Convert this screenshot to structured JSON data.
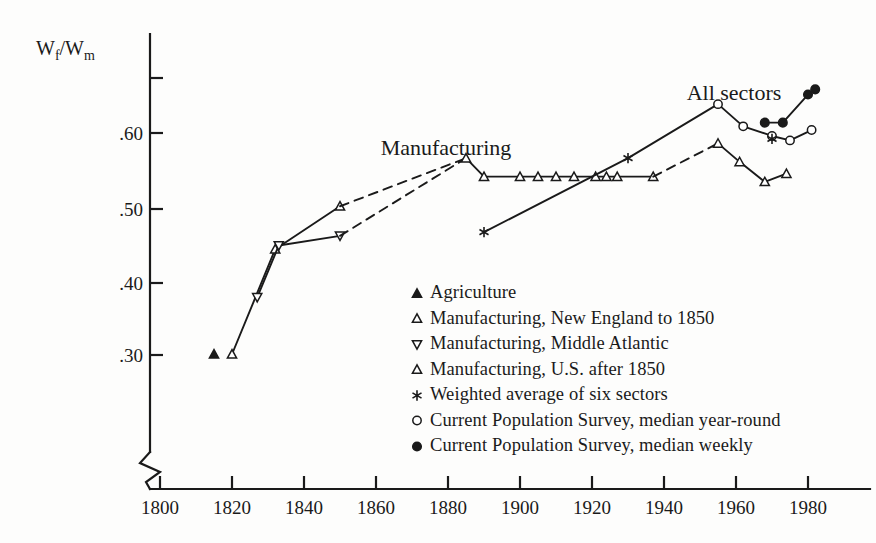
{
  "chart_data": {
    "type": "line",
    "title": "",
    "xlabel": "",
    "ylabel": "Wf/Wm",
    "ylabel_num": "W",
    "ylabel_sub1": "f",
    "ylabel_slash": "/W",
    "ylabel_sub2": "m",
    "xlim": [
      1795,
      1990
    ],
    "ylim": [
      0.28,
      0.72
    ],
    "grid": false,
    "axis_break": true,
    "legend_position": "center-right inside plot",
    "xticks": [
      "1800",
      "1820",
      "1840",
      "1860",
      "1880",
      "1900",
      "1920",
      "1940",
      "1960",
      "1980"
    ],
    "xtick_values": [
      1800,
      1820,
      1840,
      1860,
      1880,
      1900,
      1920,
      1940,
      1960,
      1980
    ],
    "yticks": [
      ".30",
      ".40",
      ".50",
      ".60"
    ],
    "ytick_values": [
      0.3,
      0.4,
      0.5,
      0.6
    ],
    "ytick_unlabeled": [
      0.7
    ],
    "annotations": [
      {
        "text": "Manufacturing",
        "x": 1873,
        "y": 0.638
      },
      {
        "text": "All sectors",
        "x": 1953,
        "y": 0.688
      }
    ],
    "series": [
      {
        "name": "Agriculture",
        "marker": "filled-triangle-up",
        "line": "none",
        "points": [
          {
            "x": 1815,
            "y": 0.301
          }
        ]
      },
      {
        "name": "Manufacturing, New England to 1850",
        "marker": "open-triangle-up",
        "line": "solid",
        "points": [
          {
            "x": 1820,
            "y": 0.301
          },
          {
            "x": 1832,
            "y": 0.443
          },
          {
            "x": 1850,
            "y": 0.501
          }
        ]
      },
      {
        "name": "Manufacturing, Middle Atlantic",
        "marker": "open-triangle-down",
        "line": "solid",
        "points": [
          {
            "x": 1827,
            "y": 0.378
          },
          {
            "x": 1833,
            "y": 0.448
          },
          {
            "x": 1850,
            "y": 0.461
          }
        ]
      },
      {
        "name": "Manufacturing, New England bridge (dashed)",
        "marker": "none",
        "line": "dashed",
        "points": [
          {
            "x": 1850,
            "y": 0.501
          },
          {
            "x": 1885,
            "y": 0.566
          }
        ]
      },
      {
        "name": "Manufacturing, Middle Atlantic bridge (dashed)",
        "marker": "none",
        "line": "dashed",
        "points": [
          {
            "x": 1850,
            "y": 0.461
          },
          {
            "x": 1885,
            "y": 0.566
          }
        ]
      },
      {
        "name": "Manufacturing, U.S. after 1850",
        "marker": "open-triangle-up",
        "line": "solid",
        "points": [
          {
            "x": 1885,
            "y": 0.566
          },
          {
            "x": 1890,
            "y": 0.541
          },
          {
            "x": 1900,
            "y": 0.541
          },
          {
            "x": 1905,
            "y": 0.541
          },
          {
            "x": 1910,
            "y": 0.541
          },
          {
            "x": 1915,
            "y": 0.541
          },
          {
            "x": 1921,
            "y": 0.541
          },
          {
            "x": 1924,
            "y": 0.541
          },
          {
            "x": 1927,
            "y": 0.541
          },
          {
            "x": 1937,
            "y": 0.541
          }
        ]
      },
      {
        "name": "Manufacturing, U.S. after 1850 bridge (dashed)",
        "marker": "none",
        "line": "dashed",
        "points": [
          {
            "x": 1937,
            "y": 0.541
          },
          {
            "x": 1955,
            "y": 0.586
          }
        ]
      },
      {
        "name": "Manufacturing, U.S. post-1955",
        "marker": "open-triangle-up",
        "line": "solid",
        "points": [
          {
            "x": 1955,
            "y": 0.586
          },
          {
            "x": 1961,
            "y": 0.561
          },
          {
            "x": 1968,
            "y": 0.534
          },
          {
            "x": 1974,
            "y": 0.545
          }
        ]
      },
      {
        "name": "Weighted average of six sectors",
        "marker": "star",
        "line": "solid",
        "points": [
          {
            "x": 1890,
            "y": 0.466
          },
          {
            "x": 1930,
            "y": 0.566
          }
        ]
      },
      {
        "name": "All sectors trend to CPS",
        "marker": "none",
        "line": "solid",
        "points": [
          {
            "x": 1930,
            "y": 0.566
          },
          {
            "x": 1955,
            "y": 0.639
          }
        ]
      },
      {
        "name": "Current Population Survey, median year-round",
        "marker": "open-circle",
        "line": "solid",
        "points": [
          {
            "x": 1955,
            "y": 0.639
          },
          {
            "x": 1962,
            "y": 0.609
          },
          {
            "x": 1970,
            "y": 0.596
          },
          {
            "x": 1975,
            "y": 0.59
          },
          {
            "x": 1981,
            "y": 0.604
          }
        ]
      },
      {
        "name": "Weighted average marker 1970",
        "marker": "star",
        "line": "none",
        "points": [
          {
            "x": 1970,
            "y": 0.592
          }
        ]
      },
      {
        "name": "Current Population Survey, median weekly",
        "marker": "filled-circle",
        "line": "solid",
        "points": [
          {
            "x": 1968,
            "y": 0.614
          },
          {
            "x": 1973,
            "y": 0.614
          },
          {
            "x": 1980,
            "y": 0.652
          },
          {
            "x": 1982,
            "y": 0.659
          }
        ]
      }
    ],
    "legend": [
      {
        "marker": "filled-triangle-up",
        "label": "Agriculture"
      },
      {
        "marker": "open-triangle-up",
        "label": "Manufacturing, New England to 1850"
      },
      {
        "marker": "open-triangle-down",
        "label": "Manufacturing, Middle Atlantic"
      },
      {
        "marker": "open-triangle-up",
        "label": "Manufacturing, U.S. after 1850"
      },
      {
        "marker": "star",
        "label": "Weighted average of six sectors"
      },
      {
        "marker": "open-circle",
        "label": "Current Population Survey, median year-round"
      },
      {
        "marker": "filled-circle",
        "label": "Current Population Survey, median weekly"
      }
    ]
  }
}
